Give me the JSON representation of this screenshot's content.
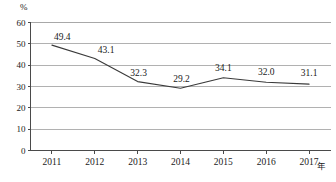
{
  "chart_data": {
    "type": "line",
    "title": "",
    "xlabel": "年",
    "ylabel": "%",
    "categories": [
      "2011",
      "2012",
      "2013",
      "2014",
      "2015",
      "2016",
      "2017"
    ],
    "values": [
      49.4,
      43.1,
      32.3,
      29.2,
      34.1,
      32.0,
      31.1
    ],
    "point_labels": [
      "49.4",
      "43.1",
      "32.3",
      "29.2",
      "34.1",
      "32.0",
      "31.1"
    ],
    "series": [
      {
        "name": "",
        "values": [
          49.4,
          43.1,
          32.3,
          29.2,
          34.1,
          32.0,
          31.1
        ]
      }
    ],
    "ylim": [
      0,
      60
    ],
    "yticks": [
      0,
      10,
      20,
      30,
      40,
      50,
      60
    ],
    "ytick_labels": [
      "0",
      "10",
      "20",
      "30",
      "40",
      "50",
      "60"
    ],
    "grid": true,
    "grid_axis": "y",
    "legend": false,
    "legend_position": "none",
    "markers": false,
    "line_color": "#3a3a3a",
    "grid_color": "#a8a8a8",
    "axis_color": "#4a4a4a",
    "text_color": "#1a1a1a",
    "background": "#ffffff"
  },
  "axes": {
    "y_unit_label": "%",
    "x_unit_label": "年"
  }
}
